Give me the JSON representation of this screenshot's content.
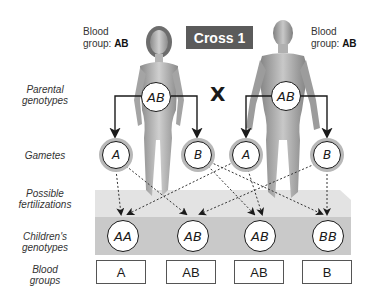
{
  "title": "Cross 1",
  "cross_symbol": "X",
  "parents": {
    "female": {
      "blood_group_label": "Blood",
      "blood_group_prefix": "group:",
      "blood_group": "AB",
      "genotype": "AB"
    },
    "male": {
      "blood_group_label": "Blood",
      "blood_group_prefix": "group:",
      "blood_group": "AB",
      "genotype": "AB"
    }
  },
  "row_labels": {
    "parental": [
      "Parental",
      "genotypes"
    ],
    "gametes": [
      "Gametes"
    ],
    "fertilizations": [
      "Possible",
      "fertilizations"
    ],
    "children": [
      "Children's",
      "genotypes"
    ],
    "blood_groups": [
      "Blood",
      "groups"
    ]
  },
  "gametes": [
    {
      "parent": "female",
      "allele": "A"
    },
    {
      "parent": "female",
      "allele": "B"
    },
    {
      "parent": "male",
      "allele": "A"
    },
    {
      "parent": "male",
      "allele": "B"
    }
  ],
  "children": [
    {
      "genotype": "AA",
      "blood_group": "A"
    },
    {
      "genotype": "AB",
      "blood_group": "AB"
    },
    {
      "genotype": "AB",
      "blood_group": "AB"
    },
    {
      "genotype": "BB",
      "blood_group": "B"
    }
  ],
  "colors": {
    "title_bg": "#5b5b5b",
    "platform_top": "#e3e3e3",
    "platform_band": "#c9c9c9",
    "line": "#1a1a1a"
  }
}
